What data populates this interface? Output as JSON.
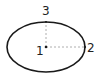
{
  "diagram": {
    "shape": "ellipse",
    "ellipse": {
      "cx": 46,
      "cy": 47,
      "rx": 39,
      "ry": 25,
      "stroke": "#1a1a1a",
      "stroke_width": 1.6
    },
    "guide_color": "#999999",
    "points": [
      {
        "id": "1",
        "label": "1",
        "position": "center",
        "x": 46,
        "y": 47
      },
      {
        "id": "2",
        "label": "2",
        "position": "right-vertex",
        "x": 85,
        "y": 47
      },
      {
        "id": "3",
        "label": "3",
        "position": "top-vertex",
        "x": 46,
        "y": 22
      }
    ],
    "labels": {
      "p1": "1",
      "p2": "2",
      "p3": "3"
    }
  }
}
